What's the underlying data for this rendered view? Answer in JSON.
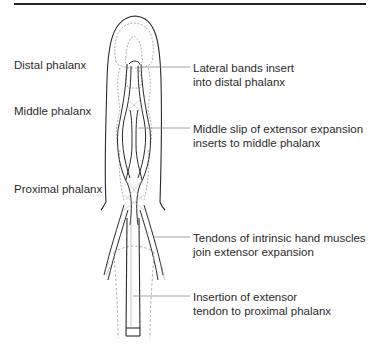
{
  "figure": {
    "left_labels": [
      {
        "text": "Distal phalanx"
      },
      {
        "text": "Middle phalanx"
      },
      {
        "text": "Proximal phalanx"
      }
    ],
    "right_labels": [
      {
        "line1": "Lateral bands insert",
        "line2": "into distal phalanx"
      },
      {
        "line1": "Middle slip of extensor expansion",
        "line2": "inserts to middle phalanx"
      },
      {
        "line1": "Tendons of intrinsic hand muscles",
        "line2": "join extensor expansion"
      },
      {
        "line1": "Insertion of extensor",
        "line2": "tendon to proximal phalanx"
      }
    ]
  },
  "colors": {
    "line": "#2a2a2a",
    "leader": "#8a8a8a",
    "dashed": "#9a9a9a",
    "background": "#ffffff"
  }
}
